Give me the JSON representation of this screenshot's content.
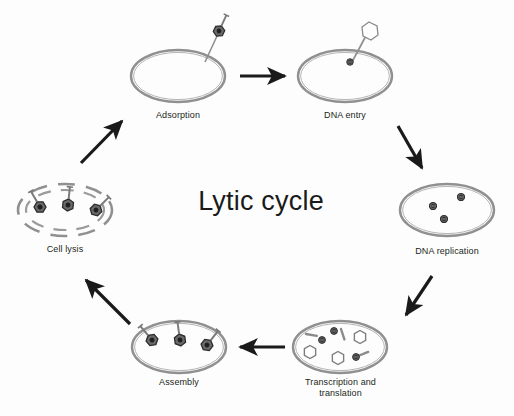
{
  "figure": {
    "title": "Lytic cycle",
    "background_color": "#fdfdfd",
    "membrane_color": "#8d8d8d",
    "arrow_color": "#1a1a1a",
    "phage_color": "#4a4a4a",
    "label_color": "#231f20"
  },
  "stages": [
    {
      "id": "adsorption",
      "label": "Adsorption",
      "description": "Phage attached to outside of intact bacterial cell",
      "cell_state": "intact",
      "cx": 178,
      "cy": 76,
      "rx": 47,
      "ry": 26,
      "label_x": 138,
      "label_y": 110,
      "label_w": 80
    },
    {
      "id": "dna-entry",
      "label": "DNA entry",
      "description": "Empty phage capsid with tail penetrating the cell wall, DNA injected",
      "cell_state": "intact",
      "cx": 345,
      "cy": 76,
      "rx": 47,
      "ry": 26,
      "label_x": 305,
      "label_y": 110,
      "label_w": 80
    },
    {
      "id": "dna-replication",
      "label": "DNA replication",
      "description": "Three copies of phage DNA inside the cell",
      "cell_state": "intact",
      "cx": 447,
      "cy": 210,
      "rx": 47,
      "ry": 26,
      "label_x": 397,
      "label_y": 246,
      "label_w": 100
    },
    {
      "id": "transcription-translation",
      "label": "Transcription and\ntranslation",
      "description": "Empty capsid heads, tail rods and DNA being produced inside the cell",
      "cell_state": "intact",
      "cx": 340,
      "cy": 347,
      "rx": 47,
      "ry": 26,
      "label_x": 288,
      "label_y": 377,
      "label_w": 105
    },
    {
      "id": "assembly",
      "label": "Assembly",
      "description": "Three complete phage particles assembled inside the cell",
      "cell_state": "intact",
      "cx": 179,
      "cy": 347,
      "rx": 47,
      "ry": 26,
      "label_x": 139,
      "label_y": 377,
      "label_w": 80
    },
    {
      "id": "cell-lysis",
      "label": "Cell lysis",
      "description": "Ruptured cell wall shown as broken arcs with three phages released",
      "cell_state": "lysed",
      "cx": 65,
      "cy": 210,
      "rx": 47,
      "ry": 26,
      "label_x": 25,
      "label_y": 244,
      "label_w": 80
    }
  ],
  "arrows": [
    {
      "id": "arrow-adsorption-to-dna-entry",
      "from": "adsorption",
      "to": "dna-entry",
      "x1": 240,
      "y1": 76,
      "x2": 288,
      "y2": 76
    },
    {
      "id": "arrow-dna-entry-to-dna-replication",
      "from": "dna-entry",
      "to": "dna-replication",
      "x1": 398,
      "y1": 126,
      "x2": 424,
      "y2": 172
    },
    {
      "id": "arrow-dna-replication-to-transcription",
      "from": "dna-replication",
      "to": "transcription-translation",
      "x1": 432,
      "y1": 276,
      "x2": 404,
      "y2": 318
    },
    {
      "id": "arrow-transcription-to-assembly",
      "from": "transcription-translation",
      "to": "assembly",
      "x1": 285,
      "y1": 347,
      "x2": 236,
      "y2": 347
    },
    {
      "id": "arrow-assembly-to-cell-lysis",
      "from": "assembly",
      "to": "cell-lysis",
      "x1": 130,
      "y1": 324,
      "x2": 84,
      "y2": 278
    },
    {
      "id": "arrow-cell-lysis-to-adsorption",
      "from": "cell-lysis",
      "to": "adsorption",
      "x1": 81,
      "y1": 163,
      "x2": 123,
      "y2": 120
    }
  ]
}
